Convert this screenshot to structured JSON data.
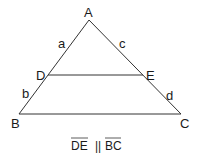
{
  "diagram": {
    "type": "triangle-proportionality",
    "stroke_color": "#333333",
    "background": "#ffffff",
    "vertices": {
      "A": {
        "label": "A",
        "x": 89,
        "y": 20
      },
      "B": {
        "label": "B",
        "x": 19,
        "y": 114
      },
      "C": {
        "label": "C",
        "x": 181,
        "y": 114
      },
      "D": {
        "label": "D",
        "x": 48,
        "y": 75
      },
      "E": {
        "label": "E",
        "x": 143,
        "y": 75
      }
    },
    "segment_labels": {
      "a": "a",
      "b": "b",
      "c": "c",
      "d": "d"
    },
    "caption": {
      "left": "DE",
      "relation": "||",
      "right": "BC"
    }
  }
}
